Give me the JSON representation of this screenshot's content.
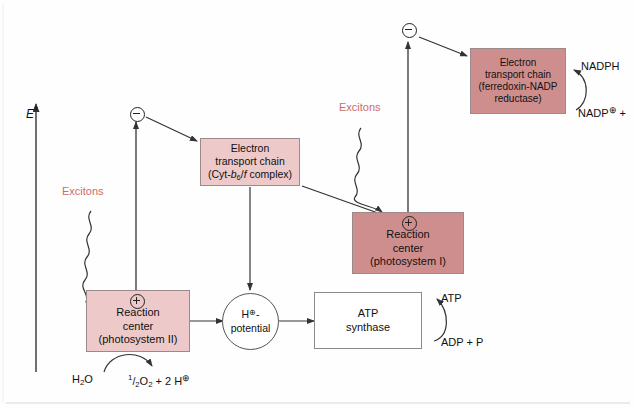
{
  "figure": {
    "background_color": "#fefefe",
    "box_light_color": "#edc9c9",
    "box_dark_color": "#cf8e8e",
    "exciton_text_color": "#cf6a6a",
    "stroke_color": "#333333"
  },
  "axis": {
    "label": "E",
    "superscript": "°"
  },
  "boxes": {
    "photosystem2": {
      "line1": "Reaction",
      "line2": "center",
      "line3": "(photosystem II)",
      "charge": "⊕",
      "fill": "#edc9c9"
    },
    "etc_cytb6f": {
      "line1": "Electron",
      "line2": "transport chain",
      "line3_prefix": "(Cyt-",
      "line3_italic_b": "b",
      "line3_sub": "6",
      "line3_slash": "/",
      "line3_italic_f": "f",
      "line3_suffix": " complex)",
      "fill": "#edc9c9"
    },
    "photosystem1": {
      "line1": "Reaction",
      "line2": "center",
      "line3": "(photosystem I)",
      "charge": "⊕",
      "fill": "#cf8e8e"
    },
    "etc_ferredoxin": {
      "line1": "Electron",
      "line2": "transport chain",
      "line3": "(ferredoxin-NADP",
      "line4": "reductase)",
      "fill": "#cf8e8e"
    },
    "atp_synthase": {
      "line1": "ATP",
      "line2": "synthase",
      "fill": "#ffffff"
    },
    "h_potential": {
      "line1_prefix": "H",
      "line1_charge": "⊕",
      "line1_suffix": "-",
      "line2": "potential",
      "fill": "#ffffff"
    }
  },
  "charges": {
    "minus_ps2": "⊖",
    "minus_ps1": "⊖",
    "plus_ps2": "⊕",
    "plus_ps1": "⊕"
  },
  "labels": {
    "excitons_left": "Excitons",
    "excitons_right": "Excitons",
    "water": "H",
    "water_sub": "2",
    "water_suffix": "O",
    "oxygen_frac_num": "1",
    "oxygen_frac_den": "2",
    "oxygen": "O",
    "oxygen_sub": "2",
    "protons": " + 2 H",
    "protons_charge": "⊕",
    "atp": "ATP",
    "adp": "ADP + P",
    "nadph": "NADPH",
    "nadp_plus_prefix": "NADP",
    "nadp_plus_charge": "⊕",
    "nadp_plus_suffix": " +"
  }
}
